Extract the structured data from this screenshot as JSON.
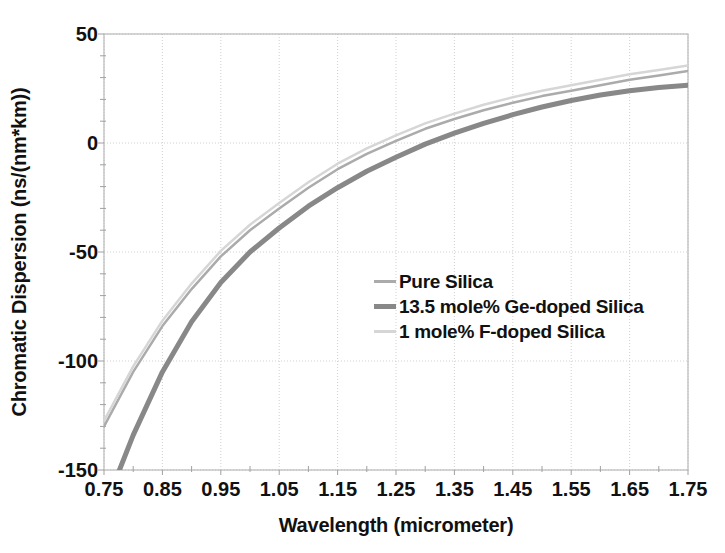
{
  "page": {
    "background": "#ffffff"
  },
  "chart_data": {
    "type": "line",
    "title": "",
    "xlabel": "Wavelength (micrometer)",
    "ylabel": "Chromatic Dispersion  (ns/(nm*km))",
    "xlim": [
      0.75,
      1.75
    ],
    "ylim": [
      -150,
      50
    ],
    "x_tick_values": [
      0.75,
      0.85,
      0.95,
      1.05,
      1.15,
      1.25,
      1.35,
      1.45,
      1.55,
      1.65,
      1.75
    ],
    "x_tick_labels": [
      "0.75",
      "0.85",
      "0.95",
      "1.05",
      "1.15",
      "1.25",
      "1.35",
      "1.45",
      "1.55",
      "1.65",
      "1.75"
    ],
    "y_tick_values": [
      50,
      0,
      -50,
      -100,
      -150
    ],
    "y_tick_labels": [
      "50",
      "0",
      "-50",
      "-100",
      "-150"
    ],
    "x_minor_step": 0.05,
    "y_minor_step": 10,
    "grid": "dotted major gridlines, both axes",
    "legend_position": "inside center-right, no border",
    "x": [
      0.75,
      0.8,
      0.85,
      0.9,
      0.95,
      1.0,
      1.05,
      1.1,
      1.15,
      1.2,
      1.25,
      1.3,
      1.35,
      1.4,
      1.45,
      1.5,
      1.55,
      1.6,
      1.65,
      1.7,
      1.75
    ],
    "series": [
      {
        "name": "Pure Silica",
        "color": "#ababab",
        "width": 2.5,
        "values": [
          -130,
          -105,
          -84,
          -67,
          -52,
          -40,
          -30,
          -20.5,
          -12,
          -5,
          1,
          6.5,
          11,
          15,
          18.5,
          21.5,
          24,
          26.5,
          29,
          31,
          33
        ]
      },
      {
        "name": "13.5 mole% Ge-doped Silica",
        "color": "#888888",
        "width": 5,
        "values": [
          -168,
          -134,
          -105,
          -82,
          -64,
          -50,
          -39,
          -29,
          -20.5,
          -13,
          -6.5,
          -0.5,
          4.5,
          9,
          13,
          16.5,
          19.5,
          22,
          24,
          25.5,
          26.5
        ]
      },
      {
        "name": "1 mole% F-doped Silica",
        "color": "#d6d6d6",
        "width": 2.5,
        "values": [
          -127.5,
          -102.5,
          -81.5,
          -64.5,
          -49.5,
          -37.5,
          -27.5,
          -18,
          -9.5,
          -2.5,
          3.5,
          9,
          13.5,
          17.5,
          21,
          24,
          26.5,
          29,
          31.5,
          33.5,
          35.5
        ]
      }
    ],
    "style_colors": {
      "gridline": "#d0d0d0",
      "plot_border": "#b9b9b9",
      "tick_mark": "#a0a0a0",
      "text": "#111111"
    }
  }
}
